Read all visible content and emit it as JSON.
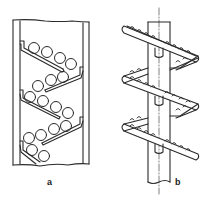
{
  "figure": {
    "panels": [
      {
        "id": "a",
        "label": "a",
        "description": "Vertical channel with inclined baffles; spheres rolling down a zig-zag path"
      },
      {
        "id": "b",
        "label": "b",
        "description": "Helical spiral chute wound around a central vertical shaft with beads on the spiral"
      }
    ]
  },
  "colors": {
    "line": "#2a2a2a",
    "background": "#ffffff"
  }
}
